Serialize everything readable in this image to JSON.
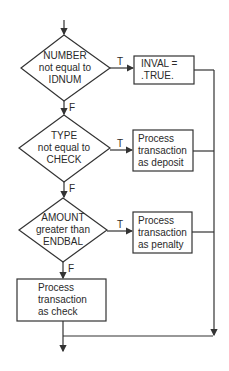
{
  "flowchart": {
    "decisions": [
      {
        "lines": [
          "NUMBER",
          "not equal to",
          "IDNUM"
        ],
        "true_label": "T",
        "false_label": "F"
      },
      {
        "lines": [
          "TYPE",
          "not equal to",
          "CHECK"
        ],
        "true_label": "T",
        "false_label": "F"
      },
      {
        "lines": [
          "AMOUNT",
          "greater than",
          "ENDBAL"
        ],
        "true_label": "T",
        "false_label": "F"
      }
    ],
    "processes": [
      {
        "lines": [
          "INVAL =",
          ".TRUE."
        ]
      },
      {
        "lines": [
          "Process",
          "transaction",
          "as deposit"
        ]
      },
      {
        "lines": [
          "Process",
          "transaction",
          "as penalty"
        ]
      },
      {
        "lines": [
          "Process",
          "transaction",
          "as check"
        ]
      }
    ],
    "colors": {
      "stroke": "#333333",
      "background": "#ffffff"
    }
  }
}
